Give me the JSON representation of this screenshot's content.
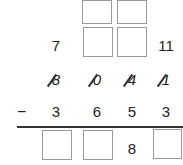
{
  "problem": {
    "type": "column subtraction with borrowing",
    "carry_row": {
      "col1": "7",
      "col4": "11"
    },
    "minuend_crossed": [
      "8",
      "0",
      "4",
      "1"
    ],
    "operator": "−",
    "subtrahend": [
      "3",
      "6",
      "5",
      "3"
    ],
    "result": {
      "col3": "8"
    }
  }
}
